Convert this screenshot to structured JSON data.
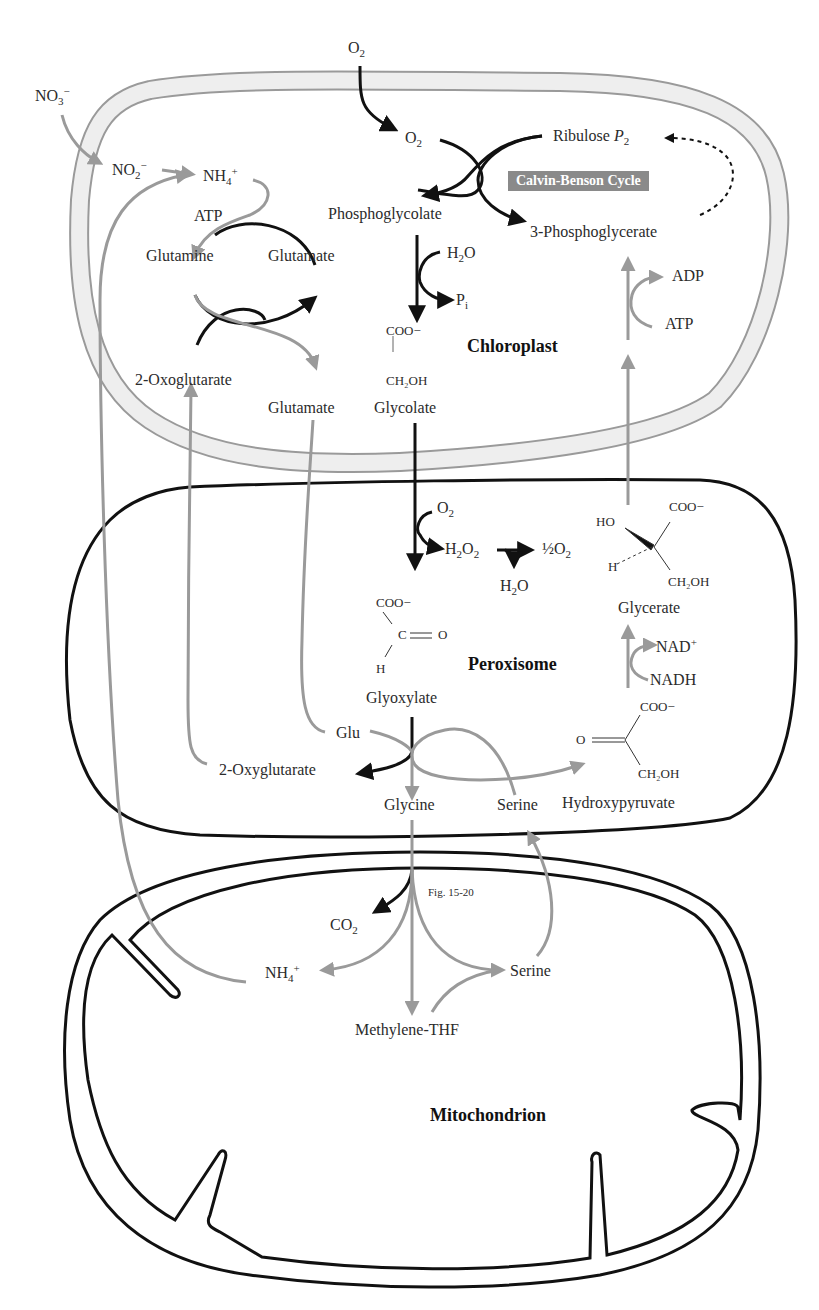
{
  "figure": {
    "caption": "Fig. 15-20",
    "compartments": {
      "chloroplast": "Chloroplast",
      "peroxisome": "Peroxisome",
      "mitochondrion": "Mitochondrion"
    },
    "badge": "Calvin-Benson Cycle",
    "colors": {
      "black_arrow": "#111111",
      "gray_arrow": "#9a9a9a",
      "chloroplast_membrane_fill": "#eeeeee",
      "chloroplast_membrane_stroke": "#9a9a9a",
      "badge_bg": "#8a8a8a"
    }
  },
  "labels": {
    "o2_top": "O",
    "o2_top_sub": "2",
    "no3": "NO",
    "no3_sub": "3",
    "no3_sup": "−",
    "no2": "NO",
    "no2_sub": "2",
    "no2_sup": "−",
    "nh4_chl": "NH",
    "nh4_chl_sub": "4",
    "nh4_chl_sup": "+",
    "o2_chl": "O",
    "o2_chl_sub": "2",
    "ribulose": "Ribulose ",
    "ribulose_p": "P",
    "ribulose_sub": "2",
    "atp_chl": "ATP",
    "phosphoglycolate": "Phosphoglycolate",
    "phosphoglycerate": "3-Phosphoglycerate",
    "h2o_chl": "H",
    "h2o_chl_sub": "2",
    "h2o_chl_tail": "O",
    "pi": "P",
    "pi_sub": "i",
    "glutamine": "Glutamine",
    "glutamate_1": "Glutamate",
    "adp": "ADP",
    "atp_right": "ATP",
    "glycolate_coo": "COO−",
    "glycolate_bar": "|",
    "glycolate_ch2oh": "CH₂OH",
    "oxoglutarate": "2-Oxoglutarate",
    "glutamate_2": "Glutamate",
    "glycolate": "Glycolate",
    "o2_per": "O",
    "o2_per_sub": "2",
    "h2o2": "H",
    "h2o2_sub1": "2",
    "h2o2_mid": "O",
    "h2o2_sub2": "2",
    "half_o2": "½O",
    "half_o2_sub": "2",
    "h2o_per": "H",
    "h2o_per_sub": "2",
    "h2o_per_tail": "O",
    "glycerate_ho": "HO",
    "glycerate_coo": "COO−",
    "glycerate_h": "H",
    "glycerate_ch2oh": "CH₂OH",
    "glycerate": "Glycerate",
    "glyoxylate_coo": "COO−",
    "glyoxylate_c": "C",
    "glyoxylate_o": "O",
    "glyoxylate_h": "H",
    "glyoxylate": "Glyoxylate",
    "nad": "NAD",
    "nad_sup": "+",
    "nadh": "NADH",
    "hp_coo": "COO−",
    "hp_o": "O",
    "hp_ch2oh": "CH₂OH",
    "hydroxypyruvate": "Hydroxypyruvate",
    "glu": "Glu",
    "oxyglutarate": "2-Oxyglutarate",
    "glycine": "Glycine",
    "serine_per": "Serine",
    "co2": "CO",
    "co2_sub": "2",
    "nh4_mito": "NH",
    "nh4_mito_sub": "4",
    "nh4_mito_sup": "+",
    "serine_mito": "Serine",
    "methylene_thf": "Methylene-THF"
  }
}
